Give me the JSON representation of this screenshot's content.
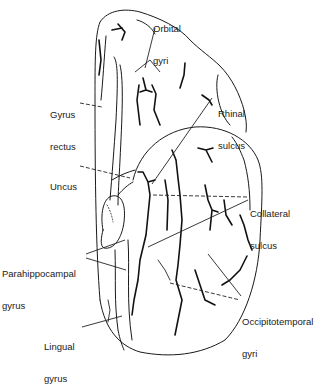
{
  "diagram": {
    "labels": {
      "orbital_gyri": {
        "line1": "Orbital",
        "line2": "gyri"
      },
      "gyrus_rectus": {
        "line1": "Gyrus",
        "line2": "rectus"
      },
      "rhinal_sulcus": {
        "line1": "Rhinal",
        "line2": "sulcus"
      },
      "uncus": {
        "line1": "Uncus"
      },
      "collateral_sulcus": {
        "line1": "Collateral",
        "line2": "sulcus"
      },
      "parahippocampal_gyrus": {
        "line1": "Parahippocampal",
        "line2": "gyrus"
      },
      "occipitotemporal_gyri": {
        "line1": "Occipitotemporal",
        "line2": "gyri"
      },
      "lingual_gyrus": {
        "line1": "Lingual",
        "line2": "gyrus"
      }
    },
    "colors": {
      "ink": "#1a1a1a",
      "background": "#ffffff"
    }
  }
}
